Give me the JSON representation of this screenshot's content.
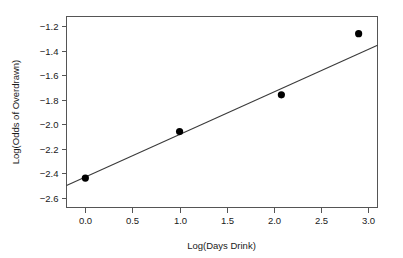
{
  "chart_data": {
    "type": "scatter",
    "title": "",
    "xlabel": "Log(Days Drink)",
    "ylabel": "Log(Odds of Overdrawn)",
    "xlim": [
      -0.2,
      3.1
    ],
    "ylim": [
      -2.68,
      -1.12
    ],
    "xticks": [
      0.0,
      0.5,
      1.0,
      1.5,
      2.0,
      2.5,
      3.0
    ],
    "xticklabels": [
      "0.0",
      "0.5",
      "1.0",
      "1.5",
      "2.0",
      "2.5",
      "3.0"
    ],
    "yticks": [
      -1.2,
      -1.4,
      -1.6,
      -1.8,
      -2.0,
      -2.2,
      -2.4,
      -2.6
    ],
    "yticklabels": [
      "−1.2",
      "−1.4",
      "−1.6",
      "−1.8",
      "−2.0",
      "−2.2",
      "−2.4",
      "−2.6"
    ],
    "grid": false,
    "legend": false,
    "series": [
      {
        "name": "observed",
        "kind": "scatter",
        "marker": "filled-circle",
        "color": "#000000",
        "points": [
          {
            "x": 0.0,
            "y": -2.44
          },
          {
            "x": 1.0,
            "y": -2.06
          },
          {
            "x": 2.08,
            "y": -1.76
          },
          {
            "x": 2.9,
            "y": -1.26
          }
        ]
      },
      {
        "name": "fitted-line",
        "kind": "line",
        "color": "#3a3a3a",
        "points": [
          {
            "x": -0.2,
            "y": -2.5
          },
          {
            "x": 3.1,
            "y": -1.355
          }
        ]
      }
    ]
  },
  "axes": {
    "x_title": "Log(Days Drink)",
    "y_title": "Log(Odds of Overdrawn)"
  }
}
